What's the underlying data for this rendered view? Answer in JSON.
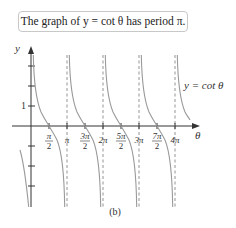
{
  "caption": "The graph of y = cot θ has period π.",
  "figure_label": "(b)",
  "axes": {
    "x_label": "θ",
    "y_label": "y",
    "y_tick_label": "1",
    "x_ticks": [
      {
        "num": "π",
        "den": "2"
      },
      {
        "text": "π"
      },
      {
        "num": "3π",
        "den": "2"
      },
      {
        "text": "2π"
      },
      {
        "num": "5π",
        "den": "2"
      },
      {
        "text": "3π"
      },
      {
        "num": "7π",
        "den": "2"
      },
      {
        "text": "4π"
      }
    ]
  },
  "curve_label": "y = cot θ",
  "colors": {
    "curve": "#9a9a9a",
    "axis": "#333333",
    "asymptote": "#888888"
  }
}
